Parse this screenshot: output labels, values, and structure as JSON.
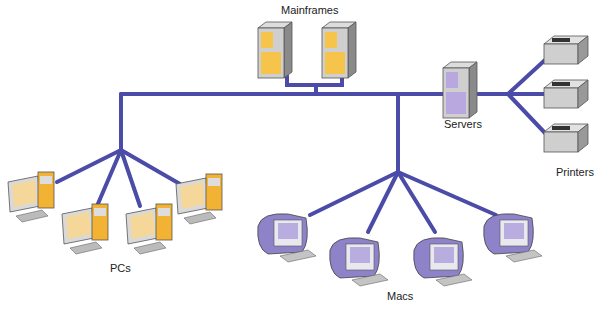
{
  "diagram": {
    "type": "network-topology",
    "link_color": "#4b4ba8",
    "groups": [
      {
        "id": "mainframes",
        "label": "Mainframes",
        "count": 2,
        "accent": "#f6c44a"
      },
      {
        "id": "servers",
        "label": "Servers",
        "count": 1,
        "accent": "#b9a8e0"
      },
      {
        "id": "printers",
        "label": "Printers",
        "count": 3,
        "accent": "#cfcfcf"
      },
      {
        "id": "pcs",
        "label": "PCs",
        "count": 4,
        "accent": "#f2b233"
      },
      {
        "id": "macs",
        "label": "Macs",
        "count": 4,
        "accent": "#8e83c9"
      }
    ]
  }
}
